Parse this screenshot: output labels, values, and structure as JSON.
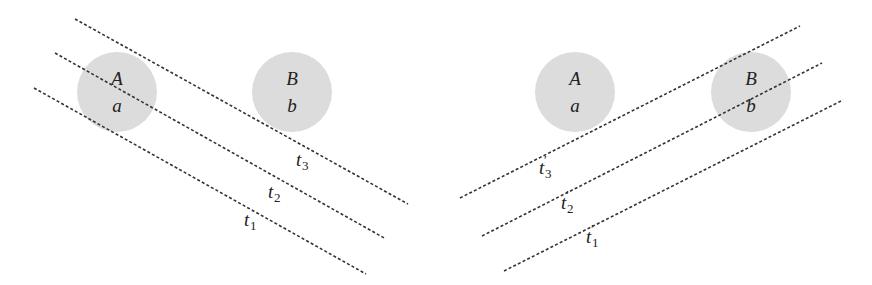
{
  "colors": {
    "background": "#ffffff",
    "circle_fill": "#dcdcdc",
    "line_stroke": "#333333",
    "text": "#222222"
  },
  "left_panel": {
    "circles": [
      {
        "id": "A",
        "upper_label": "A",
        "lower_label": "a",
        "cx": 117,
        "cy": 92,
        "r": 40
      },
      {
        "id": "B",
        "upper_label": "B",
        "lower_label": "b",
        "cx": 292,
        "cy": 92,
        "r": 40
      }
    ],
    "lines": [
      {
        "id": "t3",
        "label": "t",
        "subscript": "3",
        "prime": "",
        "x1": 75,
        "y1": 19,
        "x2": 408,
        "y2": 204,
        "label_x": 296,
        "label_y": 166
      },
      {
        "id": "t2",
        "label": "t",
        "subscript": "2",
        "prime": "",
        "x1": 55,
        "y1": 53,
        "x2": 386,
        "y2": 239,
        "label_x": 268,
        "label_y": 198
      },
      {
        "id": "t1",
        "label": "t",
        "subscript": "1",
        "prime": "",
        "x1": 34,
        "y1": 88,
        "x2": 366,
        "y2": 274,
        "label_x": 244,
        "label_y": 226
      }
    ]
  },
  "right_panel": {
    "circles": [
      {
        "id": "A",
        "upper_label": "A",
        "lower_label": "a",
        "cx": 575,
        "cy": 92,
        "r": 40
      },
      {
        "id": "B",
        "upper_label": "B",
        "lower_label": "b",
        "cx": 751,
        "cy": 92,
        "r": 40
      }
    ],
    "lines": [
      {
        "id": "t3p",
        "label": "t",
        "subscript": "3",
        "prime": "′",
        "x1": 460,
        "y1": 198,
        "x2": 800,
        "y2": 26,
        "label_x": 539,
        "label_y": 174
      },
      {
        "id": "t2p",
        "label": "t",
        "subscript": "2",
        "prime": "′",
        "x1": 482,
        "y1": 236,
        "x2": 822,
        "y2": 63,
        "label_x": 561,
        "label_y": 209
      },
      {
        "id": "t1p",
        "label": "t",
        "subscript": "1",
        "prime": "′",
        "x1": 504,
        "y1": 271,
        "x2": 843,
        "y2": 100,
        "label_x": 586,
        "label_y": 243
      }
    ]
  }
}
